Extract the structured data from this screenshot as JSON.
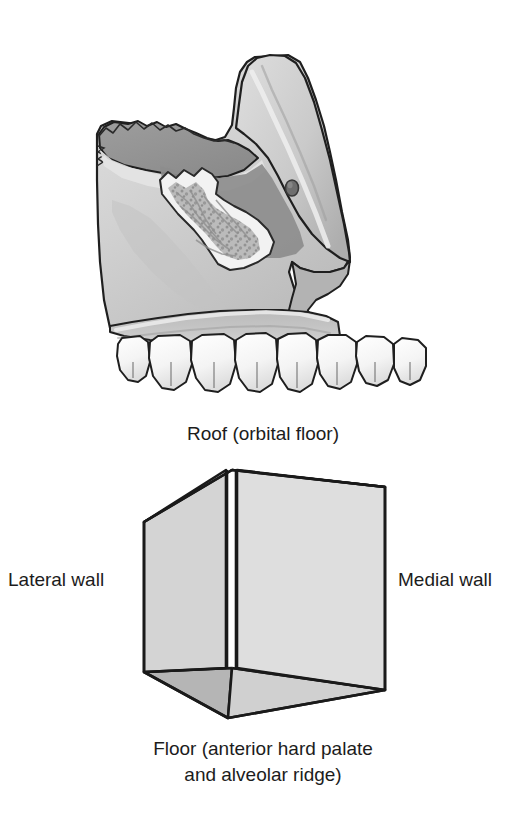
{
  "figure": {
    "background_color": "#ffffff"
  },
  "bone_illustration": {
    "name": "maxilla-sagittal-section",
    "description": "Grayscale medical illustration of a sectioned maxilla showing the maxillary sinus cavity, trabecular bone, infraorbital foramen, alveolar ridge and the maxillary tooth row",
    "parts": [
      {
        "label": "frontal-process",
        "tone": "#cfcfcf"
      },
      {
        "label": "sinus-cavity",
        "tone": "#9a9a9a"
      },
      {
        "label": "trabecular-bone-window",
        "tone": "#b4b4b4"
      },
      {
        "label": "infraorbital-foramen",
        "tone": "#6e6e6e"
      },
      {
        "label": "alveolar-ridge",
        "tone": "#c6c6c6"
      },
      {
        "label": "tooth-row",
        "tone": "#fdfdfd"
      }
    ],
    "tooth_count": 8,
    "colors": {
      "outline": "#1f1f1f",
      "bone_light": "#d8d8d8",
      "bone_mid": "#bcbcbc",
      "bone_dark": "#989898",
      "cavity_shadow": "#8d8d8d",
      "tooth_fill": "#fdfdfd"
    }
  },
  "schematic_box": {
    "name": "maxillary-sinus-pyramid-schematic",
    "description": "Open rectangular box drawn in perspective representing the boundaries of the maxillary sinus",
    "colors": {
      "outline": "#1a1a1a",
      "top_face": "#a9a9a9",
      "left_face": "#d4d4d4",
      "right_face": "#dedede",
      "bottom_left_face": "#b5b5b5",
      "bottom_right_face": "#d0d0d0",
      "front_edge_gap": "#ffffff"
    },
    "vertices": {
      "top_front": [
        232,
        470
      ],
      "top_back_left": [
        144,
        522
      ],
      "top_back_right": [
        385,
        487
      ],
      "bottom_front": [
        232,
        668
      ],
      "bottom_back_left": [
        144,
        672
      ],
      "bottom_back_right": [
        385,
        690
      ],
      "near_bottom_left": [
        228,
        718
      ],
      "near_bottom_right": [
        385,
        690
      ]
    }
  },
  "labels": {
    "roof": "Roof (orbital floor)",
    "lateral_wall": "Lateral wall",
    "medial_wall": "Medial wall",
    "floor_line1": "Floor (anterior hard palate",
    "floor_line2": "and alveolar ridge)",
    "text_color": "#1c1c1c"
  }
}
